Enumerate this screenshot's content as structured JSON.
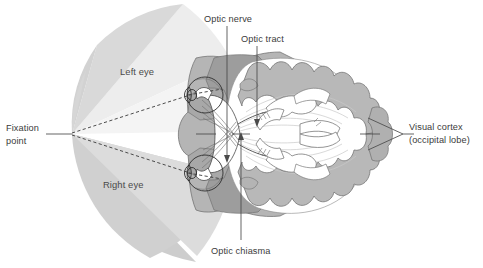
{
  "figure": {
    "background_color": "#ffffff"
  },
  "labels": {
    "optic_nerve": "Optic nerve",
    "optic_tract": "Optic tract",
    "optic_chiasma": "Optic chiasma",
    "fixation_point_line1": "Fixation",
    "fixation_point_line2": "point",
    "visual_cortex_line1": "Visual cortex",
    "visual_cortex_line2": "(occipital lobe)",
    "left_eye_field": "Left eye",
    "right_eye_field": "Right eye"
  },
  "colors": {
    "field_light": "#ececec",
    "field_mid": "#d8d8d8",
    "field_dark": "#c6c6c6",
    "brain_gray": "#b0b0b0",
    "brain_dark": "#9a9a9a",
    "tissue_gray": "#bfbfbf",
    "outline": "#2e2e2e",
    "text": "#3b3b3b",
    "white": "#ffffff"
  },
  "structures": {
    "left_eye": "left-eyeball",
    "right_eye": "right-eyeball",
    "chiasma": "optic-chiasma-crossing",
    "brain": "brain-horizontal-section",
    "cortex": "occipital-visual-cortex"
  }
}
